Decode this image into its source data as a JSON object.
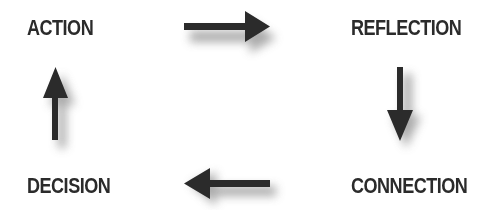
{
  "diagram": {
    "type": "cycle",
    "nodes": [
      {
        "id": "action",
        "label": "ACTION"
      },
      {
        "id": "reflection",
        "label": "REFLECTION"
      },
      {
        "id": "connection",
        "label": "CONNECTION"
      },
      {
        "id": "decision",
        "label": "DECISION"
      }
    ],
    "edges": [
      {
        "from": "action",
        "to": "reflection",
        "direction": "right"
      },
      {
        "from": "reflection",
        "to": "connection",
        "direction": "down"
      },
      {
        "from": "connection",
        "to": "decision",
        "direction": "left"
      },
      {
        "from": "decision",
        "to": "action",
        "direction": "up"
      }
    ],
    "colors": {
      "text": "#2b2b2b",
      "arrow": "#2b2b2b",
      "shadow": "#9a9a9a",
      "background": "#ffffff"
    }
  }
}
